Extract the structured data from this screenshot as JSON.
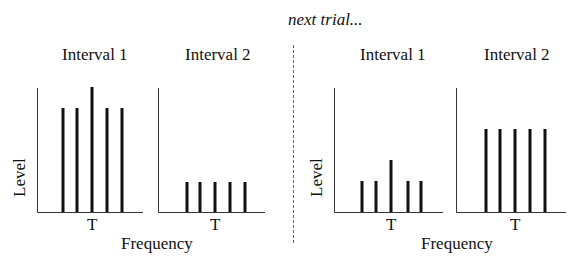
{
  "header": {
    "next_trial": "next trial..."
  },
  "axis_labels": {
    "y": "Level",
    "x": "Frequency",
    "tick": "T"
  },
  "colors": {
    "bar": "#111111",
    "axis": "#333333",
    "divider": "#666666"
  },
  "trials": [
    {
      "panels": [
        {
          "title": "Interval 1",
          "origin_x": 37,
          "axis_end": 143,
          "bars": [
            {
              "x": 63,
              "top": 108
            },
            {
              "x": 77,
              "top": 108
            },
            {
              "x": 92,
              "top": 87
            },
            {
              "x": 107,
              "top": 108
            },
            {
              "x": 122,
              "top": 108
            }
          ]
        },
        {
          "title": "Interval 2",
          "origin_x": 158,
          "axis_end": 265,
          "bars": [
            {
              "x": 187,
              "top": 182
            },
            {
              "x": 200,
              "top": 182
            },
            {
              "x": 215,
              "top": 182
            },
            {
              "x": 230,
              "top": 182
            },
            {
              "x": 245,
              "top": 182
            }
          ]
        }
      ]
    },
    {
      "panels": [
        {
          "title": "Interval 1",
          "origin_x": 334,
          "axis_end": 443,
          "bars": [
            {
              "x": 362,
              "top": 181
            },
            {
              "x": 376,
              "top": 181
            },
            {
              "x": 391,
              "top": 160
            },
            {
              "x": 408,
              "top": 181
            },
            {
              "x": 421,
              "top": 181
            }
          ]
        },
        {
          "title": "Interval 2",
          "origin_x": 456,
          "axis_end": 566,
          "bars": [
            {
              "x": 486,
              "top": 129
            },
            {
              "x": 500,
              "top": 129
            },
            {
              "x": 515,
              "top": 129
            },
            {
              "x": 530,
              "top": 129
            },
            {
              "x": 545,
              "top": 129
            }
          ]
        }
      ]
    }
  ],
  "layout": {
    "axis_top": 88,
    "baseline": 212
  }
}
